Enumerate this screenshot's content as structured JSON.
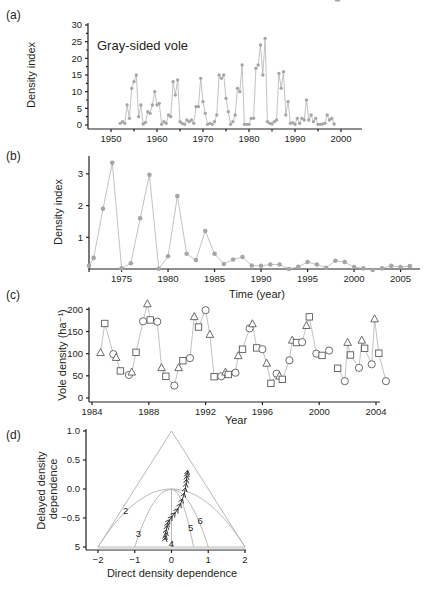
{
  "figure": {
    "panels": [
      {
        "id": "a",
        "label": "(a)"
      },
      {
        "id": "b",
        "label": "(b)"
      },
      {
        "id": "c",
        "label": "(c)"
      },
      {
        "id": "d",
        "label": "(d)"
      }
    ]
  },
  "colors": {
    "axis": "#231f20",
    "series_gray": "#a6a6a6",
    "line_gray": "#b3b3b3",
    "marker_stroke": "#5a5a5a"
  },
  "chart_data": [
    {
      "panel": "(a)",
      "type": "line",
      "title": "Gray-sided vole",
      "xlabel": "",
      "ylabel": "Density index",
      "xlim": [
        1945,
        2004
      ],
      "ylim": [
        0,
        30
      ],
      "xticks": [
        1950,
        1960,
        1970,
        1980,
        1990,
        2000
      ],
      "yticks": [
        0,
        5,
        10,
        15,
        20,
        25,
        30
      ],
      "grid": false,
      "x": [
        1952,
        1952.5,
        1953,
        1953.5,
        1954,
        1954.5,
        1955,
        1955.5,
        1956,
        1956.5,
        1957,
        1957.5,
        1958,
        1958.5,
        1959,
        1959.5,
        1960,
        1960.5,
        1961,
        1961.5,
        1962,
        1962.5,
        1963,
        1963.5,
        1964,
        1964.5,
        1965,
        1965.5,
        1966,
        1966.5,
        1967,
        1967.5,
        1968,
        1968.5,
        1969,
        1969.5,
        1970,
        1970.5,
        1971,
        1971.5,
        1972,
        1972.5,
        1973,
        1973.5,
        1974,
        1974.5,
        1975,
        1975.5,
        1976,
        1976.5,
        1977,
        1977.5,
        1978,
        1978.5,
        1979,
        1979.5,
        1980,
        1980.5,
        1981,
        1981.5,
        1982,
        1982.5,
        1983,
        1983.5,
        1984,
        1984.5,
        1985,
        1985.5,
        1986,
        1986.5,
        1987,
        1987.5,
        1988,
        1988.5,
        1989,
        1989.5,
        1990,
        1990.5,
        1991,
        1991.5,
        1992,
        1992.5,
        1993,
        1993.5,
        1994,
        1994.5,
        1995,
        1995.5,
        1996,
        1996.5,
        1997,
        1997.5,
        1998,
        1998.5,
        1999,
        1999.5
      ],
      "values": [
        0.5,
        1,
        0.5,
        6,
        2,
        11,
        13,
        15,
        2.5,
        6,
        0.3,
        0.8,
        4,
        3.5,
        6,
        10,
        6,
        6.5,
        0.2,
        1,
        0.5,
        3,
        2.5,
        13,
        9,
        13.5,
        1,
        0.5,
        0.2,
        1.5,
        1,
        1.5,
        0.5,
        5.5,
        5.5,
        14,
        7,
        3.5,
        0.2,
        0.5,
        0.2,
        1,
        3,
        15,
        14,
        15,
        8,
        4,
        0.2,
        1,
        3,
        11,
        10,
        18,
        0.2,
        0.2,
        0.2,
        2,
        2,
        17,
        18,
        24,
        15,
        26,
        1,
        0.5,
        0.3,
        1,
        1.5,
        15.5,
        11,
        16,
        3,
        7,
        0.5,
        0.7,
        0.2,
        2,
        0.5,
        2,
        1.5,
        7.5,
        1.5,
        3,
        1,
        2,
        0.2,
        0.2,
        0.3,
        0.5,
        3,
        1.5,
        2,
        0.3
      ],
      "marker": "filled-circle"
    },
    {
      "panel": "(b)",
      "type": "line",
      "title": "",
      "xlabel": "Time (year)",
      "ylabel": "Density index",
      "xlim": [
        1971.5,
        2006
      ],
      "ylim": [
        0,
        3.5
      ],
      "xticks": [
        1975,
        1980,
        1985,
        1990,
        1995,
        2000,
        2005
      ],
      "yticks": [
        1,
        2,
        3
      ],
      "grid": false,
      "x": [
        1971.5,
        1972,
        1973,
        1974,
        1975,
        1976,
        1977,
        1978,
        1979,
        1980,
        1981,
        1982,
        1983,
        1984,
        1985,
        1986,
        1987,
        1988,
        1989,
        1990,
        1991,
        1992,
        1993,
        1994,
        1995,
        1996,
        1997,
        1998,
        1999,
        2000,
        2001,
        2002,
        2003,
        2004,
        2005,
        2006
      ],
      "values": [
        0.1,
        0.35,
        1.9,
        3.35,
        0.02,
        0.18,
        1.6,
        2.97,
        0.01,
        0.4,
        2.3,
        0.48,
        0.28,
        1.2,
        0.48,
        0.16,
        0.3,
        0.38,
        0.11,
        0.1,
        0.14,
        0.14,
        0.0,
        0.07,
        0.22,
        0.14,
        0.04,
        0.26,
        0.22,
        0.06,
        0.02,
        -0.03,
        0.02,
        0.1,
        0.06,
        0.09
      ],
      "marker": "filled-circle"
    },
    {
      "panel": "(c)",
      "type": "line",
      "title": "",
      "xlabel": "Year",
      "ylabel": "Vole density (ha⁻¹)",
      "xlim": [
        1984,
        2004.3
      ],
      "ylim": [
        0,
        200
      ],
      "xticks": [
        1984,
        1988,
        1992,
        1996,
        2000,
        2004
      ],
      "yticks": [
        0,
        50,
        100,
        150,
        200
      ],
      "grid": false,
      "marker_legend": {
        "triangle": "open-triangle",
        "square": "open-square",
        "circle": "open-circle"
      },
      "segments": [
        [
          {
            "x": 1984.6,
            "y": 102,
            "m": "triangle"
          },
          {
            "x": 1984.9,
            "y": 168,
            "m": "square"
          },
          {
            "x": 1985.5,
            "y": 99,
            "m": "circle"
          },
          {
            "x": 1985.7,
            "y": 91,
            "m": "triangle"
          },
          {
            "x": 1986.0,
            "y": 61,
            "m": "square"
          },
          {
            "x": 1986.6,
            "y": 52,
            "m": "circle"
          },
          {
            "x": 1986.8,
            "y": 58,
            "m": "triangle"
          },
          {
            "x": 1987.1,
            "y": 103,
            "m": "square"
          },
          {
            "x": 1987.6,
            "y": 173,
            "m": "circle"
          },
          {
            "x": 1987.9,
            "y": 212,
            "m": "triangle"
          },
          {
            "x": 1988.1,
            "y": 176,
            "m": "square"
          },
          {
            "x": 1988.6,
            "y": 172,
            "m": "circle"
          },
          {
            "x": 1988.9,
            "y": 68,
            "m": "triangle"
          },
          {
            "x": 1989.2,
            "y": 49,
            "m": "square"
          },
          {
            "x": 1989.8,
            "y": 28,
            "m": "circle"
          },
          {
            "x": 1990.1,
            "y": 68,
            "m": "triangle"
          },
          {
            "x": 1990.4,
            "y": 84,
            "m": "square"
          },
          {
            "x": 1990.9,
            "y": 90,
            "m": "circle"
          },
          {
            "x": 1991.2,
            "y": 183,
            "m": "triangle"
          },
          {
            "x": 1991.5,
            "y": 160,
            "m": "square"
          },
          {
            "x": 1992.0,
            "y": 198,
            "m": "circle"
          },
          {
            "x": 1992.3,
            "y": 143,
            "m": "triangle"
          },
          {
            "x": 1992.6,
            "y": 48,
            "m": "square"
          },
          {
            "x": 1993.1,
            "y": 49,
            "m": "circle"
          },
          {
            "x": 1993.4,
            "y": 58,
            "m": "triangle"
          },
          {
            "x": 1993.6,
            "y": 53,
            "m": "square"
          },
          {
            "x": 1994.1,
            "y": 57,
            "m": "circle"
          },
          {
            "x": 1994.3,
            "y": 95,
            "m": "triangle"
          },
          {
            "x": 1994.6,
            "y": 110,
            "m": "square"
          },
          {
            "x": 1995.1,
            "y": 157,
            "m": "circle"
          },
          {
            "x": 1995.3,
            "y": 167,
            "m": "triangle"
          },
          {
            "x": 1995.6,
            "y": 113,
            "m": "square"
          },
          {
            "x": 1996.0,
            "y": 110,
            "m": "circle"
          },
          {
            "x": 1996.3,
            "y": 78,
            "m": "triangle"
          },
          {
            "x": 1996.6,
            "y": 33,
            "m": "square"
          },
          {
            "x": 1997.0,
            "y": 55,
            "m": "circle"
          },
          {
            "x": 1997.2,
            "y": 49,
            "m": "triangle"
          },
          {
            "x": 1997.4,
            "y": 42,
            "m": "square"
          },
          {
            "x": 1997.9,
            "y": 85,
            "m": "circle"
          },
          {
            "x": 1998.1,
            "y": 130,
            "m": "triangle"
          },
          {
            "x": 1998.4,
            "y": 125,
            "m": "square"
          },
          {
            "x": 1998.8,
            "y": 126,
            "m": "circle"
          },
          {
            "x": 1999.1,
            "y": 163,
            "m": "triangle"
          },
          {
            "x": 1999.3,
            "y": 183,
            "m": "square"
          },
          {
            "x": 1999.8,
            "y": 100,
            "m": "circle"
          }
        ],
        [
          {
            "x": 2000.2,
            "y": 96,
            "m": "square"
          },
          {
            "x": 2000.7,
            "y": 107,
            "m": "circle"
          }
        ],
        [
          {
            "x": 2001.3,
            "y": 67,
            "m": "square"
          },
          {
            "x": 2001.8,
            "y": 38,
            "m": "circle"
          },
          {
            "x": 2002.0,
            "y": 125,
            "m": "triangle"
          },
          {
            "x": 2002.2,
            "y": 97,
            "m": "square"
          },
          {
            "x": 2002.8,
            "y": 68,
            "m": "circle"
          },
          {
            "x": 2003.0,
            "y": 130,
            "m": "triangle"
          },
          {
            "x": 2003.2,
            "y": 112,
            "m": "square"
          },
          {
            "x": 2003.7,
            "y": 76,
            "m": "circle"
          },
          {
            "x": 2003.9,
            "y": 178,
            "m": "triangle"
          },
          {
            "x": 2004.2,
            "y": 101,
            "m": "square"
          },
          {
            "x": 2004.7,
            "y": 38,
            "m": "circle"
          }
        ]
      ]
    },
    {
      "panel": "(d)",
      "type": "line",
      "title": "",
      "xlabel": "Direct density dependence",
      "ylabel": "Delayed density dependence",
      "xlim": [
        -2,
        2
      ],
      "ylim": [
        -1,
        1
      ],
      "xticks": [
        -2,
        -1,
        0,
        1,
        2
      ],
      "ytick_labels": [
        "5",
        "−0.5",
        "0.0",
        "0.5",
        "1.0"
      ],
      "yticks": [
        -1,
        -0.5,
        0,
        0.5,
        1
      ],
      "grid": false,
      "triangle": [
        [
          -2,
          -1
        ],
        [
          0,
          1
        ],
        [
          2,
          -1
        ]
      ],
      "region_curves": [
        {
          "label": "2",
          "type": "parabola",
          "from": [
            -2,
            -1
          ],
          "apex": [
            0,
            0
          ],
          "to": [
            2,
            -1
          ],
          "label_pos": [
            -1.25,
            -0.38
          ]
        },
        {
          "label": "3",
          "type": "curve",
          "from": [
            -1,
            -1
          ],
          "to": [
            0,
            0
          ],
          "label_pos": [
            -0.9,
            -0.78
          ]
        },
        {
          "label": "4",
          "type": "vertical",
          "from": [
            0,
            0
          ],
          "to": [
            0,
            -1
          ],
          "label_pos": [
            0,
            -0.94
          ]
        },
        {
          "label": "5",
          "type": "curve",
          "from": [
            0,
            0
          ],
          "to": [
            0.6,
            -1
          ],
          "label_pos": [
            0.52,
            -0.67
          ]
        },
        {
          "label": "6",
          "type": "curve",
          "from": [
            0,
            0
          ],
          "to": [
            1,
            -1
          ],
          "label_pos": [
            0.78,
            -0.56
          ]
        }
      ],
      "trajectory": {
        "marker": "arrowhead",
        "x": [
          -0.18,
          -0.17,
          -0.15,
          -0.16,
          -0.14,
          -0.12,
          -0.1,
          -0.05,
          0.02,
          0.1,
          0.18,
          0.25,
          0.3,
          0.35,
          0.38,
          0.4,
          0.41,
          0.42,
          0.43,
          0.44
        ],
        "y": [
          -0.88,
          -0.84,
          -0.8,
          -0.75,
          -0.7,
          -0.63,
          -0.58,
          -0.53,
          -0.47,
          -0.41,
          -0.34,
          -0.25,
          -0.17,
          -0.07,
          0.02,
          0.1,
          0.17,
          0.23,
          0.28,
          0.32
        ]
      }
    }
  ]
}
